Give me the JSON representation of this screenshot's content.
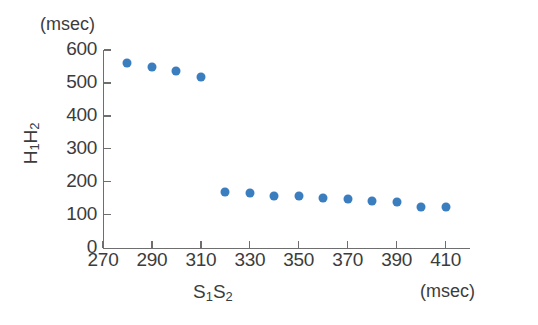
{
  "chart_data": {
    "type": "scatter",
    "title": "",
    "xlabel": "S1S2",
    "ylabel": "H1H2",
    "x_unit": "(msec)",
    "y_unit": "(msec)",
    "xlim": [
      270,
      420
    ],
    "ylim": [
      0,
      600
    ],
    "x_ticks": [
      270,
      290,
      310,
      330,
      350,
      370,
      390,
      410
    ],
    "y_ticks": [
      0,
      100,
      200,
      300,
      400,
      500,
      600
    ],
    "grid": false,
    "legend": null,
    "marker_color": "#3a7ebf",
    "axis_color": "#6e6e6e",
    "text_color": "#3c3c3c",
    "series": [
      {
        "name": "H1H2 interval",
        "x": [
          280,
          290,
          300,
          310,
          320,
          330,
          340,
          350,
          360,
          370,
          380,
          390,
          400,
          410
        ],
        "y": [
          562,
          547,
          537,
          518,
          168,
          167,
          158,
          158,
          152,
          148,
          143,
          139,
          124,
          122
        ]
      }
    ]
  },
  "axis_labels": {
    "y_unit": "(msec)",
    "x_unit": "(msec)",
    "y_title_main": "H",
    "y_title_sub1": "1",
    "y_title_mid": "H",
    "y_title_sub2": "2",
    "x_title_main": "S",
    "x_title_sub1": "1",
    "x_title_mid": "S",
    "x_title_sub2": "2"
  }
}
